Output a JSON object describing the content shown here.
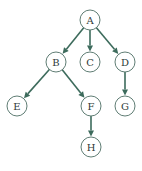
{
  "diagram": {
    "type": "directed-tree",
    "colors": {
      "edge": "#3d6b5c",
      "node_stroke": "#5f7d74",
      "node_fill": "#ffffff",
      "label": "#2e3b38",
      "background": "#ffffff"
    },
    "node_radius": 10,
    "nodes": [
      {
        "id": "A",
        "label": "A",
        "x": 90,
        "y": 20
      },
      {
        "id": "B",
        "label": "B",
        "x": 56,
        "y": 62
      },
      {
        "id": "C",
        "label": "C",
        "x": 90,
        "y": 62
      },
      {
        "id": "D",
        "label": "D",
        "x": 125,
        "y": 62
      },
      {
        "id": "E",
        "label": "E",
        "x": 17,
        "y": 106
      },
      {
        "id": "F",
        "label": "F",
        "x": 91,
        "y": 106
      },
      {
        "id": "G",
        "label": "G",
        "x": 125,
        "y": 106
      },
      {
        "id": "H",
        "label": "H",
        "x": 91,
        "y": 147
      }
    ],
    "edges": [
      {
        "from": "A",
        "to": "B"
      },
      {
        "from": "A",
        "to": "C"
      },
      {
        "from": "A",
        "to": "D"
      },
      {
        "from": "B",
        "to": "E"
      },
      {
        "from": "B",
        "to": "F"
      },
      {
        "from": "D",
        "to": "G"
      },
      {
        "from": "F",
        "to": "H"
      }
    ]
  }
}
